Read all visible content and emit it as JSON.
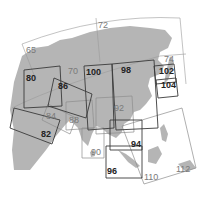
{
  "map": {
    "title": "Asia map page index",
    "region": "Asia",
    "page_labels": {
      "p65": "65",
      "p70": "70",
      "p72": "72",
      "p74": "74",
      "p80": "80",
      "p82": "82",
      "p84": "84",
      "p86": "86",
      "p88": "88",
      "p90": "90",
      "p92": "92",
      "p94": "94",
      "p96": "96",
      "p98": "98",
      "p100": "100",
      "p102": "102",
      "p104": "104",
      "p110": "110",
      "p112": "112"
    },
    "colors": {
      "land": "#b5b5b5",
      "frame_dark": "#3a3a3a",
      "frame_light": "#8c8c8c",
      "background": "#ffffff"
    }
  }
}
